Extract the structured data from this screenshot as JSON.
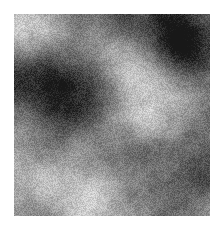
{
  "image": {
    "kind": "grayscale-noise-texture",
    "description": "Fractal cloud noise texture, grayscale, grainy",
    "background_color": "#ffffff",
    "canvas_width": 224,
    "canvas_height": 231,
    "texture": {
      "x": 14,
      "y": 14,
      "width": 196,
      "height": 202,
      "mean_gray": 128,
      "min_gray": 24,
      "max_gray": 240,
      "grain_amplitude": 26,
      "octaves": 6,
      "base_cells": 3,
      "persistence": 0.56,
      "lacunarity": 2.0,
      "seed": 20873,
      "contrast": 1.22,
      "blobs": [
        {
          "name": "bright-upper-left",
          "cx": 0.07,
          "cy": 0.05,
          "r": 0.18,
          "amp": 0.62
        },
        {
          "name": "bright-upper-mid",
          "cx": 0.34,
          "cy": 0.09,
          "r": 0.16,
          "amp": 0.4
        },
        {
          "name": "dark-upper-right",
          "cx": 0.78,
          "cy": 0.07,
          "r": 0.22,
          "amp": -0.68
        },
        {
          "name": "dark-upper-right-2",
          "cx": 0.93,
          "cy": 0.2,
          "r": 0.14,
          "amp": -0.52
        },
        {
          "name": "bright-center-upper",
          "cx": 0.55,
          "cy": 0.26,
          "r": 0.13,
          "amp": 0.46
        },
        {
          "name": "dark-mid-left",
          "cx": 0.12,
          "cy": 0.32,
          "r": 0.18,
          "amp": -0.46
        },
        {
          "name": "dark-center-left",
          "cx": 0.29,
          "cy": 0.43,
          "r": 0.17,
          "amp": -0.55
        },
        {
          "name": "bright-mid-right",
          "cx": 0.8,
          "cy": 0.4,
          "r": 0.16,
          "amp": 0.5
        },
        {
          "name": "bright-center",
          "cx": 0.48,
          "cy": 0.62,
          "r": 0.15,
          "amp": 0.3
        },
        {
          "name": "dark-lower-center",
          "cx": 0.62,
          "cy": 0.74,
          "r": 0.18,
          "amp": -0.4
        },
        {
          "name": "bright-lower-left",
          "cx": 0.16,
          "cy": 0.78,
          "r": 0.17,
          "amp": 0.52
        },
        {
          "name": "bright-bottom-mid",
          "cx": 0.38,
          "cy": 0.93,
          "r": 0.16,
          "amp": 0.56
        },
        {
          "name": "dark-lower-right",
          "cx": 0.88,
          "cy": 0.82,
          "r": 0.18,
          "amp": -0.44
        },
        {
          "name": "dark-bottom-right",
          "cx": 0.72,
          "cy": 0.97,
          "r": 0.14,
          "amp": -0.34
        }
      ]
    }
  }
}
